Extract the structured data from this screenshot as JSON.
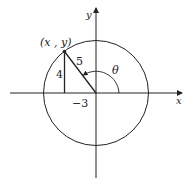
{
  "diagram": {
    "type": "unit-circle-angle",
    "circle_radius_label": "5",
    "point_label": "(x , y)",
    "vertical_leg_label": "4",
    "horizontal_leg_label": "−3",
    "angle_label": "θ",
    "x_axis_label": "x",
    "y_axis_label": "y"
  },
  "colors": {
    "stroke": "#222222",
    "background": "#ffffff"
  }
}
